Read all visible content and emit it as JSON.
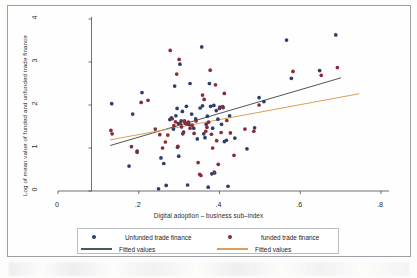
{
  "chart_data": {
    "type": "scatter",
    "title": "",
    "xlabel": "Digital adoption – business sub–index",
    "ylabel": "Log of mean value of funded and unfunded trade finance",
    "xlim": [
      0,
      0.8
    ],
    "ylim": [
      0,
      4
    ],
    "xticks": [
      "0",
      ".2",
      ".4",
      ".6",
      ".8"
    ],
    "xtick_values": [
      0,
      0.2,
      0.4,
      0.6,
      0.8
    ],
    "yticks": [
      "0",
      "1",
      "2",
      "3",
      "4"
    ],
    "ytick_values": [
      0,
      1,
      2,
      3,
      4
    ],
    "grid": false,
    "legend_position": "below-axis",
    "colors": {
      "unfunded_point": "#2b3f6b",
      "funded_point": "#8a2b38",
      "unfunded_fit": "#4a5a52",
      "funded_fit": "#d9a05b",
      "frame": "#9aa0a6",
      "text": "#2b2b2b"
    },
    "series": [
      {
        "name": "Unfunded trade finance",
        "marker": "circle",
        "color": "#2b3f6b",
        "points": [
          [
            0.133,
            2.03
          ],
          [
            0.176,
            0.58
          ],
          [
            0.185,
            1.79
          ],
          [
            0.196,
            0.93
          ],
          [
            0.208,
            2.29
          ],
          [
            0.249,
            0.05
          ],
          [
            0.255,
            0.77
          ],
          [
            0.262,
            0.64
          ],
          [
            0.268,
            0.13
          ],
          [
            0.277,
            1.66
          ],
          [
            0.281,
            1.7
          ],
          [
            0.286,
            1.44
          ],
          [
            0.289,
            2.44
          ],
          [
            0.292,
            1.75
          ],
          [
            0.295,
            1.92
          ],
          [
            0.296,
            1.02
          ],
          [
            0.298,
            1.57
          ],
          [
            0.299,
            0.81
          ],
          [
            0.302,
            2.95
          ],
          [
            0.305,
            1.63
          ],
          [
            0.308,
            1.85
          ],
          [
            0.311,
            1.37
          ],
          [
            0.314,
            1.61
          ],
          [
            0.318,
            1.97
          ],
          [
            0.321,
            0.14
          ],
          [
            0.324,
            1.55
          ],
          [
            0.327,
            2.5
          ],
          [
            0.331,
            1.79
          ],
          [
            0.336,
            1.46
          ],
          [
            0.341,
            1.68
          ],
          [
            0.345,
            1.21
          ],
          [
            0.352,
            1.93
          ],
          [
            0.356,
            3.35
          ],
          [
            0.358,
            1.98
          ],
          [
            0.361,
            1.33
          ],
          [
            0.364,
            1.24
          ],
          [
            0.367,
            1.55
          ],
          [
            0.37,
            1.74
          ],
          [
            0.372,
            0.09
          ],
          [
            0.375,
            2.5
          ],
          [
            0.378,
            1.97
          ],
          [
            0.381,
            0.4
          ],
          [
            0.383,
            1.46
          ],
          [
            0.386,
            1.99
          ],
          [
            0.388,
            0.42
          ],
          [
            0.392,
            1.87
          ],
          [
            0.396,
            1.67
          ],
          [
            0.401,
            1.95
          ],
          [
            0.405,
            1.55
          ],
          [
            0.409,
            1.94
          ],
          [
            0.412,
            1.15
          ],
          [
            0.417,
            1.18
          ],
          [
            0.421,
            0.11
          ],
          [
            0.425,
            1.75
          ],
          [
            0.438,
            1.23
          ],
          [
            0.468,
            0.98
          ],
          [
            0.487,
            1.47
          ],
          [
            0.498,
            2.17
          ],
          [
            0.51,
            2.08
          ],
          [
            0.566,
            3.51
          ],
          [
            0.578,
            2.62
          ],
          [
            0.648,
            2.8
          ],
          [
            0.688,
            3.63
          ]
        ]
      },
      {
        "name": "funded trade finance",
        "marker": "circle",
        "color": "#8a2b38",
        "points": [
          [
            0.131,
            1.41
          ],
          [
            0.134,
            1.33
          ],
          [
            0.182,
            1.03
          ],
          [
            0.196,
            0.9
          ],
          [
            0.206,
            2.06
          ],
          [
            0.223,
            2.11
          ],
          [
            0.241,
            1.44
          ],
          [
            0.252,
            1.31
          ],
          [
            0.259,
            1.0
          ],
          [
            0.266,
            1.14
          ],
          [
            0.272,
            1.3
          ],
          [
            0.278,
            3.27
          ],
          [
            0.283,
            1.68
          ],
          [
            0.287,
            1.52
          ],
          [
            0.291,
            1.61
          ],
          [
            0.294,
            2.72
          ],
          [
            0.297,
            1.04
          ],
          [
            0.3,
            3.06
          ],
          [
            0.303,
            1.58
          ],
          [
            0.306,
            1.49
          ],
          [
            0.309,
            1.33
          ],
          [
            0.313,
            1.63
          ],
          [
            0.316,
            1.57
          ],
          [
            0.319,
            1.56
          ],
          [
            0.323,
            1.6
          ],
          [
            0.327,
            1.46
          ],
          [
            0.332,
            1.53
          ],
          [
            0.337,
            1.34
          ],
          [
            0.342,
            1.63
          ],
          [
            0.347,
            0.66
          ],
          [
            0.351,
            0.39
          ],
          [
            0.354,
            0.36
          ],
          [
            0.358,
            2.23
          ],
          [
            0.362,
            2.13
          ],
          [
            0.366,
            1.39
          ],
          [
            0.369,
            1.48
          ],
          [
            0.373,
            1.6
          ],
          [
            0.377,
            2.81
          ],
          [
            0.38,
            1.32
          ],
          [
            0.383,
            1.0
          ],
          [
            0.387,
            0.44
          ],
          [
            0.39,
            2.47
          ],
          [
            0.393,
            1.17
          ],
          [
            0.397,
            0.62
          ],
          [
            0.4,
            1.92
          ],
          [
            0.404,
            1.36
          ],
          [
            0.408,
            1.96
          ],
          [
            0.412,
            2.27
          ],
          [
            0.418,
            1.64
          ],
          [
            0.427,
            1.35
          ],
          [
            0.436,
            0.83
          ],
          [
            0.463,
            1.44
          ],
          [
            0.485,
            1.39
          ],
          [
            0.498,
            2.0
          ],
          [
            0.582,
            2.78
          ],
          [
            0.652,
            2.69
          ],
          [
            0.692,
            2.87
          ]
        ]
      }
    ],
    "fits": [
      {
        "name": "Fitted values",
        "for": "Unfunded trade finance",
        "color": "#4a5a52",
        "x0": 0.13,
        "y0": 1.06,
        "x1": 0.7,
        "y1": 2.63
      },
      {
        "name": "Fitted values",
        "for": "funded trade finance",
        "color": "#d9a05b",
        "x0": 0.13,
        "y0": 1.19,
        "x1": 0.745,
        "y1": 2.26
      }
    ]
  },
  "legend": {
    "items": [
      {
        "label": "Unfunded trade finance",
        "type": "dot",
        "color": "#2b3f6b"
      },
      {
        "label": "funded trade finance",
        "type": "dot",
        "color": "#8a2b38"
      },
      {
        "label": "Fitted values",
        "type": "line",
        "color": "#4a5a52"
      },
      {
        "label": "Fitted values",
        "type": "line",
        "color": "#d9a05b"
      }
    ]
  }
}
